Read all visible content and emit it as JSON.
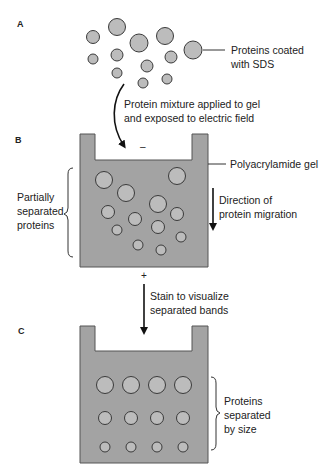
{
  "panels": {
    "A": {
      "label": "A",
      "callout": [
        "Proteins coated",
        "with SDS"
      ],
      "protein_count": 13
    },
    "transition_AB": {
      "text": [
        "Protein mixture applied to gel",
        "and exposed to electric field"
      ]
    },
    "B": {
      "label": "B",
      "gel_label": "Polyacrylamide gel",
      "bracket_label": [
        "Partially",
        "separated",
        "proteins"
      ],
      "migration_label": [
        "Direction of",
        "protein migration"
      ],
      "negative_sign": "–",
      "positive_sign": "+",
      "protein_count": 12
    },
    "transition_BC": {
      "text": [
        "Stain to visualize",
        "separated bands"
      ]
    },
    "C": {
      "label": "C",
      "bracket_label": [
        "Proteins",
        "separated",
        "by size"
      ],
      "rows": 3,
      "columns": 4
    }
  },
  "colors": {
    "gel": "#a3a3a3",
    "protein": "#bcbcbc",
    "outline": "#3a3a3a"
  }
}
